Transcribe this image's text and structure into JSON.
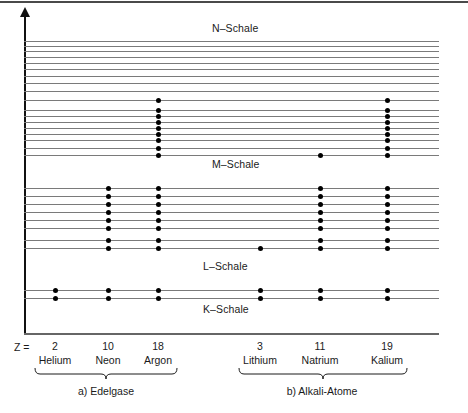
{
  "figure": {
    "axis": {
      "z_label": "Z ="
    },
    "shell_labels": [
      {
        "name": "N-Schale",
        "text": "N–Schale",
        "x": 212,
        "y": 22
      },
      {
        "name": "M-Schale",
        "text": "M–Schale",
        "x": 212,
        "y": 158
      },
      {
        "name": "L-Schale",
        "text": "L–Schale",
        "x": 203,
        "y": 260
      },
      {
        "name": "K-Schale",
        "text": "K–Schale",
        "x": 203,
        "y": 303
      }
    ],
    "columns": [
      {
        "name": "helium",
        "z": "2",
        "element": "Helium",
        "x": 55
      },
      {
        "name": "neon",
        "z": "10",
        "element": "Neon",
        "x": 108
      },
      {
        "name": "argon",
        "z": "18",
        "element": "Argon",
        "x": 158
      },
      {
        "name": "lithium",
        "z": "3",
        "element": "Lithium",
        "x": 260
      },
      {
        "name": "natrium",
        "z": "11",
        "element": "Natrium",
        "x": 320
      },
      {
        "name": "kalium",
        "z": "19",
        "element": "Kalium",
        "x": 387
      }
    ],
    "groups": [
      {
        "name": "edelgase",
        "marker": "a)",
        "label": "Edelgase",
        "center": 106,
        "from": 34,
        "to": 178
      },
      {
        "name": "alkali-atome",
        "marker": "b)",
        "label": "Alkali-Atome",
        "center": 322,
        "from": 238,
        "to": 408
      }
    ]
  },
  "chart_data": {
    "type": "scatter",
    "xlabel": "Z =",
    "ylabel": "E",
    "grid": false,
    "legend": "none",
    "categories": [
      "Helium",
      "Neon",
      "Argon",
      "Lithium",
      "Natrium",
      "Kalium"
    ],
    "atomic_numbers": [
      2,
      10,
      18,
      3,
      11,
      19
    ],
    "groups": [
      "Edelgase",
      "Edelgase",
      "Edelgase",
      "Alkali-Atome",
      "Alkali-Atome",
      "Alkali-Atome"
    ],
    "shells": [
      "N-Schale",
      "M-Schale",
      "L-Schale",
      "K-Schale"
    ],
    "levels": [
      {
        "y": 41,
        "shell": "N",
        "occupied_by": []
      },
      {
        "y": 46,
        "shell": "N",
        "occupied_by": []
      },
      {
        "y": 51,
        "shell": "N",
        "occupied_by": []
      },
      {
        "y": 57,
        "shell": "N",
        "occupied_by": []
      },
      {
        "y": 63,
        "shell": "N",
        "occupied_by": []
      },
      {
        "y": 69,
        "shell": "N",
        "occupied_by": []
      },
      {
        "y": 76,
        "shell": "N",
        "occupied_by": []
      },
      {
        "y": 83,
        "shell": "N",
        "occupied_by": []
      },
      {
        "y": 91,
        "shell": "N",
        "occupied_by": []
      },
      {
        "y": 100,
        "shell": "M",
        "occupied_by": [
          "argon",
          "kalium"
        ]
      },
      {
        "y": 110,
        "shell": "M",
        "occupied_by": [
          "argon",
          "kalium"
        ]
      },
      {
        "y": 116,
        "shell": "M",
        "occupied_by": [
          "argon",
          "kalium"
        ]
      },
      {
        "y": 122,
        "shell": "M",
        "occupied_by": [
          "argon",
          "kalium"
        ]
      },
      {
        "y": 128,
        "shell": "M",
        "occupied_by": [
          "argon",
          "kalium"
        ]
      },
      {
        "y": 134,
        "shell": "M",
        "occupied_by": [
          "argon",
          "kalium"
        ]
      },
      {
        "y": 140,
        "shell": "M",
        "occupied_by": [
          "argon",
          "kalium"
        ]
      },
      {
        "y": 148,
        "shell": "M",
        "occupied_by": [
          "argon",
          "kalium"
        ]
      },
      {
        "y": 155,
        "shell": "M",
        "occupied_by": [
          "argon",
          "natrium",
          "kalium"
        ]
      },
      {
        "y": 188,
        "shell": "L",
        "occupied_by": [
          "neon",
          "argon",
          "natrium",
          "kalium"
        ]
      },
      {
        "y": 196,
        "shell": "L",
        "occupied_by": [
          "neon",
          "argon",
          "natrium",
          "kalium"
        ]
      },
      {
        "y": 204,
        "shell": "L",
        "occupied_by": [
          "neon",
          "argon",
          "natrium",
          "kalium"
        ]
      },
      {
        "y": 212,
        "shell": "L",
        "occupied_by": [
          "neon",
          "argon",
          "natrium",
          "kalium"
        ]
      },
      {
        "y": 220,
        "shell": "L",
        "occupied_by": [
          "neon",
          "argon",
          "natrium",
          "kalium"
        ]
      },
      {
        "y": 228,
        "shell": "L",
        "occupied_by": [
          "neon",
          "argon",
          "natrium",
          "kalium"
        ]
      },
      {
        "y": 240,
        "shell": "L",
        "occupied_by": [
          "neon",
          "argon",
          "natrium",
          "kalium"
        ]
      },
      {
        "y": 248,
        "shell": "L",
        "occupied_by": [
          "neon",
          "argon",
          "lithium",
          "natrium",
          "kalium"
        ]
      },
      {
        "y": 290,
        "shell": "K",
        "occupied_by": [
          "helium",
          "neon",
          "argon",
          "lithium",
          "natrium",
          "kalium"
        ]
      },
      {
        "y": 298,
        "shell": "K",
        "occupied_by": [
          "helium",
          "neon",
          "argon",
          "lithium",
          "natrium",
          "kalium"
        ]
      }
    ]
  }
}
